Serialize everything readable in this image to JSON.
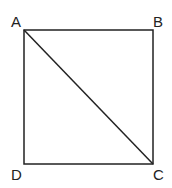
{
  "diagram": {
    "type": "square-with-diagonal",
    "stroke_color": "#222222",
    "vertices": {
      "A": {
        "label": "A",
        "x": 24,
        "y": 30
      },
      "B": {
        "label": "B",
        "x": 153,
        "y": 30
      },
      "C": {
        "label": "C",
        "x": 153,
        "y": 164
      },
      "D": {
        "label": "D",
        "x": 24,
        "y": 164
      }
    },
    "edges": [
      "AB",
      "BC",
      "CD",
      "DA",
      "AC"
    ]
  }
}
